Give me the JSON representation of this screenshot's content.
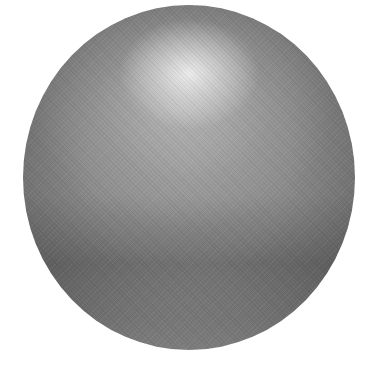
{
  "image": {
    "subject": "shaded gray sphere",
    "background_color": "#ffffff",
    "colors": {
      "highlight": "#e8e8e8",
      "midtone": "#8a8a8a",
      "shadow_band": "#5a5a5a",
      "edge": "#6a6a6a"
    }
  }
}
